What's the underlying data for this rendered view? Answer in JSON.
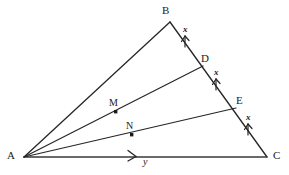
{
  "figure": {
    "kind": "geometry-diagram",
    "background_color": "#ffffff",
    "stroke_color": "#262626",
    "label_color": "#1b1b1b",
    "width": 289,
    "height": 175
  },
  "vertices": [
    {
      "id": "A",
      "label": "A",
      "x": 24,
      "y": 157,
      "label_x": 8,
      "label_y": 151
    },
    {
      "id": "B",
      "label": "B",
      "x": 170,
      "y": 22,
      "label_x": 165,
      "label_y": 6
    },
    {
      "id": "C",
      "label": "C",
      "x": 267,
      "y": 157,
      "label_x": 273,
      "label_y": 151
    }
  ],
  "division_points": [
    {
      "id": "D",
      "label": "D",
      "x": 203,
      "y": 66,
      "label_x": 203,
      "label_y": 54
    },
    {
      "id": "E",
      "label": "E",
      "x": 236,
      "y": 108,
      "label_x": 237,
      "label_y": 96
    }
  ],
  "marked_points": [
    {
      "id": "M",
      "label": "M",
      "x": 116,
      "y": 112,
      "label_x": 109,
      "label_y": 99,
      "on_segment": "AD"
    },
    {
      "id": "N",
      "label": "N",
      "x": 132,
      "y": 135,
      "label_x": 126,
      "label_y": 122,
      "on_segment": "AE"
    }
  ],
  "segments": [
    {
      "id": "AB",
      "from": "A",
      "to": "B"
    },
    {
      "id": "BC",
      "from": "B",
      "to": "C"
    },
    {
      "id": "AC",
      "from": "A",
      "to": "C"
    },
    {
      "id": "AD",
      "from": "A",
      "to": "D"
    },
    {
      "id": "AE",
      "from": "A",
      "to": "E"
    }
  ],
  "tick_marks": [
    {
      "id": "x-BD",
      "label": "x",
      "segment": "B-D",
      "label_x": 185,
      "label_y": 28,
      "arrow_x": 185,
      "arrow_y": 43
    },
    {
      "id": "x-DE",
      "label": "x",
      "segment": "D-E",
      "label_x": 216,
      "label_y": 71,
      "arrow_x": 216,
      "arrow_y": 86
    },
    {
      "id": "x-EC",
      "label": "x",
      "segment": "E-C",
      "label_x": 248,
      "label_y": 116,
      "arrow_x": 248,
      "arrow_y": 131
    }
  ],
  "base_marker": {
    "id": "y-AC",
    "label": "y",
    "label_x": 145,
    "label_y": 158,
    "arrow_x": 132,
    "arrow_y": 155
  }
}
